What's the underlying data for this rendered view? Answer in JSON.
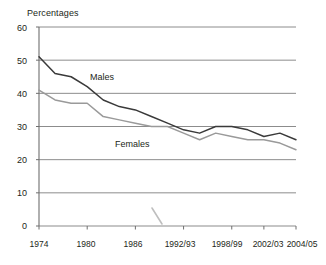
{
  "chart_data": {
    "type": "line",
    "title": "Percentages",
    "xlabel": "",
    "ylabel": "Percentages",
    "ylim": [
      0,
      60
    ],
    "yticks": [
      0,
      10,
      20,
      30,
      40,
      50,
      60
    ],
    "grid": true,
    "legend_position": "inline-annotation",
    "categories": [
      "1974",
      "1976",
      "1978",
      "1980",
      "1982",
      "1984",
      "1986",
      "1988",
      "1990",
      "1992/93",
      "1994/95",
      "1996/97",
      "1998/99",
      "2000/01",
      "2002/03",
      "2003/04",
      "2004/05"
    ],
    "tick_labels": [
      "1974",
      "1980",
      "1986",
      "1992/93",
      "1998/99",
      "2002/03",
      "2004/05"
    ],
    "series": [
      {
        "name": "Males",
        "color": "#3a3a3a",
        "values": [
          51,
          46,
          45,
          42,
          38,
          36,
          35,
          33,
          31,
          29,
          28,
          30,
          30,
          29,
          27,
          28,
          26
        ]
      },
      {
        "name": "Females",
        "color": "#9a9a9a",
        "values": [
          41,
          38,
          37,
          37,
          33,
          32,
          31,
          30,
          30,
          28,
          26,
          28,
          27,
          26,
          26,
          25,
          23
        ]
      }
    ],
    "annotations": [
      {
        "text": "Males",
        "x": "1983",
        "y": 46
      },
      {
        "text": "Females",
        "x": "1989",
        "y": 25
      }
    ]
  },
  "axis": {
    "y_tick_labels": [
      "60",
      "50",
      "40",
      "30",
      "20",
      "10",
      "0"
    ],
    "x_tick_labels": [
      "1974",
      "1980",
      "1986",
      "1992/93",
      "1998/99",
      "2002/03",
      "2004/05"
    ]
  },
  "labels": {
    "title": "Percentages",
    "males": "Males",
    "females": "Females"
  }
}
